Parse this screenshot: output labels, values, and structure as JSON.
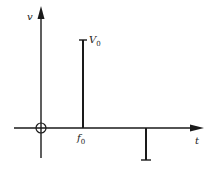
{
  "diagram": {
    "type": "spectrum-impulse-plot",
    "axes": {
      "y_label": "v",
      "x_label": "t",
      "origin_marker": "circle"
    },
    "impulses": [
      {
        "position_label": "f",
        "position_sub": "0",
        "height_label": "V",
        "height_sub": "0",
        "direction": "up"
      },
      {
        "position_label": "",
        "height_label": "",
        "direction": "down"
      }
    ],
    "colors": {
      "stroke": "#1a1a1a",
      "background": "#ffffff"
    }
  }
}
